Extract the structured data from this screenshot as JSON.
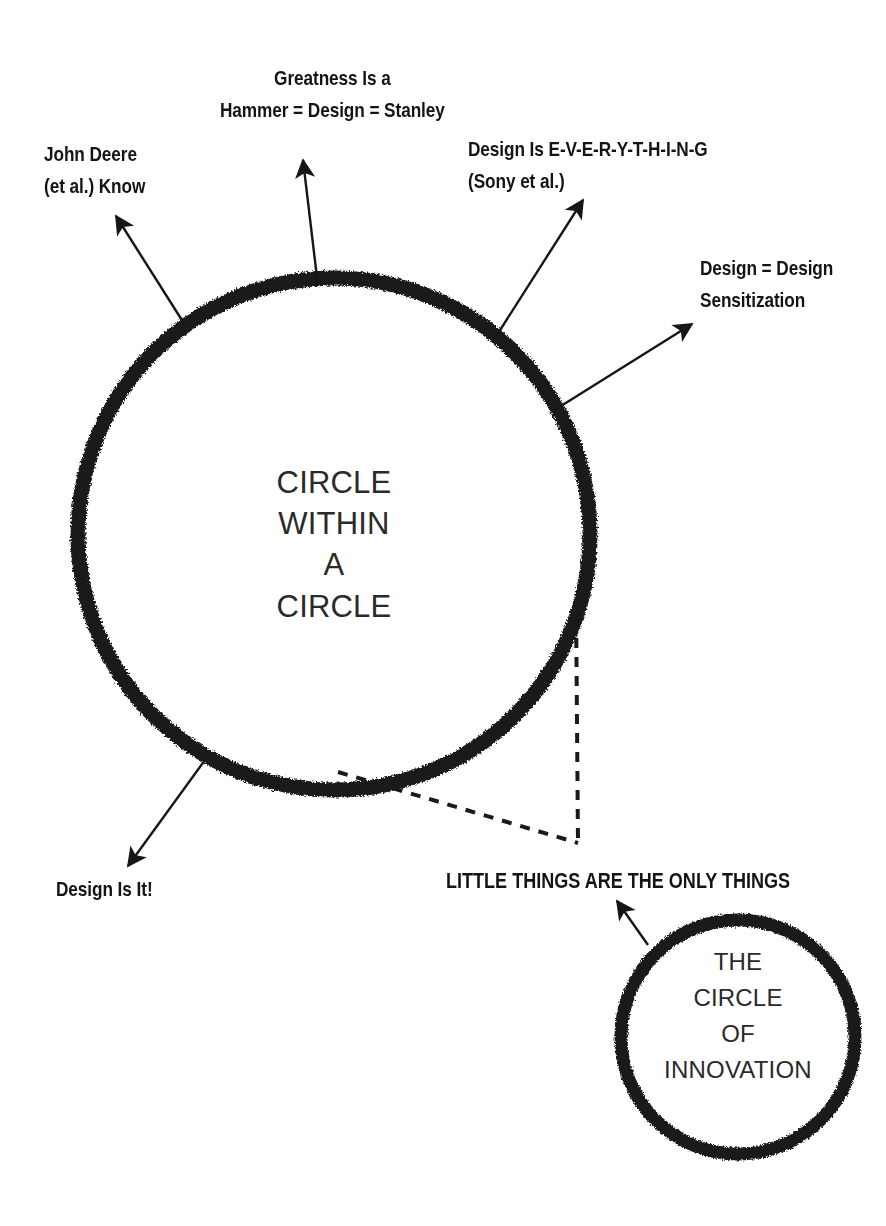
{
  "diagram": {
    "title": "Circle Within a Circle",
    "background_color": "#ffffff",
    "ink_color": "#1a1a1a",
    "main_circle": {
      "lines": [
        "CIRCLE",
        "WITHIN",
        "A",
        "CIRCLE"
      ],
      "center": [
        334,
        534
      ],
      "radius": 256,
      "stroke_width": 15
    },
    "small_circle": {
      "lines": [
        "THE",
        "CIRCLE",
        "OF",
        "INNOVATION"
      ],
      "center": [
        738,
        1037
      ],
      "radius": 117,
      "stroke_width": 13
    },
    "callout": {
      "label": "LITTLE THINGS ARE THE ONLY THINGS",
      "style": "dashed"
    },
    "annotations": [
      {
        "name": "john-deere",
        "lines": [
          "John Deere",
          "(et al.) Know"
        ],
        "arrow": {
          "from": [
            185,
            325
          ],
          "to": [
            116,
            216
          ]
        }
      },
      {
        "name": "greatness-hammer",
        "lines": [
          "Greatness Is a",
          "Hammer = Design = Stanley"
        ],
        "arrow": {
          "from": [
            318,
            286
          ],
          "to": [
            303,
            160
          ]
        }
      },
      {
        "name": "design-is-everything",
        "lines": [
          "Design Is E-V-E-R-Y-T-H-I-N-G",
          "(Sony et al.)"
        ],
        "arrow": {
          "from": [
            495,
            338
          ],
          "to": [
            583,
            200
          ]
        }
      },
      {
        "name": "design-sensitization",
        "lines": [
          "Design = Design",
          "Sensitization"
        ],
        "arrow": {
          "from": [
            553,
            411
          ],
          "to": [
            692,
            324
          ]
        }
      },
      {
        "name": "design-is-it",
        "lines": [
          "Design Is It!"
        ],
        "arrow": {
          "from": [
            205,
            760
          ],
          "to": [
            128,
            866
          ]
        }
      },
      {
        "name": "little-things",
        "lines": [
          "LITTLE THINGS ARE THE ONLY THINGS"
        ],
        "arrow": {
          "from": [
            648,
            945
          ],
          "to": [
            617,
            901
          ]
        }
      }
    ]
  }
}
